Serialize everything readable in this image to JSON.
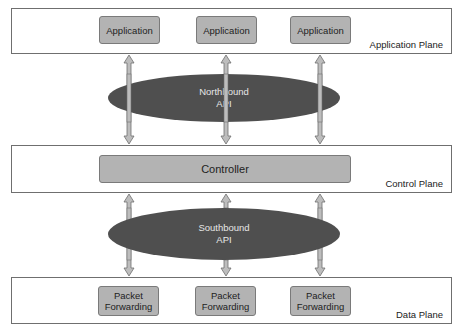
{
  "diagram": {
    "planes": {
      "application": {
        "label": "Application Plane"
      },
      "control": {
        "label": "Control Plane"
      },
      "data": {
        "label": "Data Plane"
      }
    },
    "application_boxes": [
      {
        "label": "Application"
      },
      {
        "label": "Application"
      },
      {
        "label": "Application"
      }
    ],
    "controller": {
      "label": "Controller"
    },
    "northbound_api": {
      "line1": "Northbound",
      "line2": "API"
    },
    "southbound_api": {
      "line1": "Southbound",
      "line2": "API"
    },
    "forwarding_boxes": [
      {
        "line1": "Packet",
        "line2": "Forwarding"
      },
      {
        "line1": "Packet",
        "line2": "Forwarding"
      },
      {
        "line1": "Packet",
        "line2": "Forwarding"
      }
    ],
    "colors": {
      "box_fill": "#b3b3b3",
      "ellipse_fill": "#4f4f4f",
      "arrow_fill": "#bdbdbd",
      "border": "#6f6f6f"
    }
  }
}
